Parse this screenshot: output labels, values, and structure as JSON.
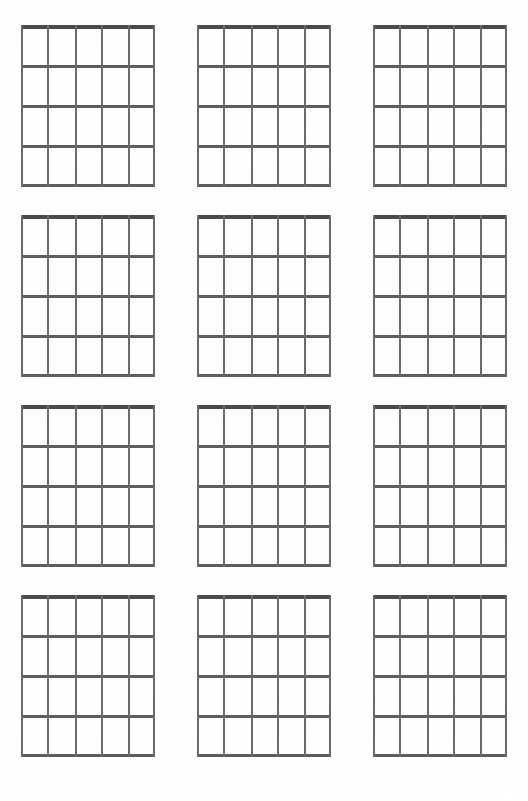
{
  "page": {
    "background_color": "#fdfdfd",
    "width": 528,
    "height": 801
  },
  "colors": {
    "nut": "#4a4a4a",
    "fret": "#5d5d5d",
    "string": "#6a6a6a",
    "paper": "#fdfdfd"
  },
  "chart_sheet": {
    "type": "guitar-chord-chart",
    "columns": 3,
    "rows": 4,
    "diagram_count": 12,
    "strings_per_diagram": 6,
    "frets_per_diagram": 4,
    "fret_lines_per_diagram": 5,
    "has_labels": false,
    "has_finger_dots": false,
    "is_blank_template": true,
    "diagrams": [
      {
        "index": 1,
        "row": 1,
        "column": 1,
        "label": "",
        "strings": 6,
        "frets": 4
      },
      {
        "index": 2,
        "row": 1,
        "column": 2,
        "label": "",
        "strings": 6,
        "frets": 4
      },
      {
        "index": 3,
        "row": 1,
        "column": 3,
        "label": "",
        "strings": 6,
        "frets": 4
      },
      {
        "index": 4,
        "row": 2,
        "column": 1,
        "label": "",
        "strings": 6,
        "frets": 4
      },
      {
        "index": 5,
        "row": 2,
        "column": 2,
        "label": "",
        "strings": 6,
        "frets": 4
      },
      {
        "index": 6,
        "row": 2,
        "column": 3,
        "label": "",
        "strings": 6,
        "frets": 4
      },
      {
        "index": 7,
        "row": 3,
        "column": 1,
        "label": "",
        "strings": 6,
        "frets": 4
      },
      {
        "index": 8,
        "row": 3,
        "column": 2,
        "label": "",
        "strings": 6,
        "frets": 4
      },
      {
        "index": 9,
        "row": 3,
        "column": 3,
        "label": "",
        "strings": 6,
        "frets": 4
      },
      {
        "index": 10,
        "row": 4,
        "column": 1,
        "label": "",
        "strings": 6,
        "frets": 4
      },
      {
        "index": 11,
        "row": 4,
        "column": 2,
        "label": "",
        "strings": 6,
        "frets": 4
      },
      {
        "index": 12,
        "row": 4,
        "column": 3,
        "label": "",
        "strings": 6,
        "frets": 4
      }
    ],
    "geometry": {
      "string_x_positions": [
        0,
        26,
        54,
        80,
        107,
        132
      ],
      "fret_y_positions": [
        0,
        40,
        80,
        120,
        159
      ]
    }
  }
}
